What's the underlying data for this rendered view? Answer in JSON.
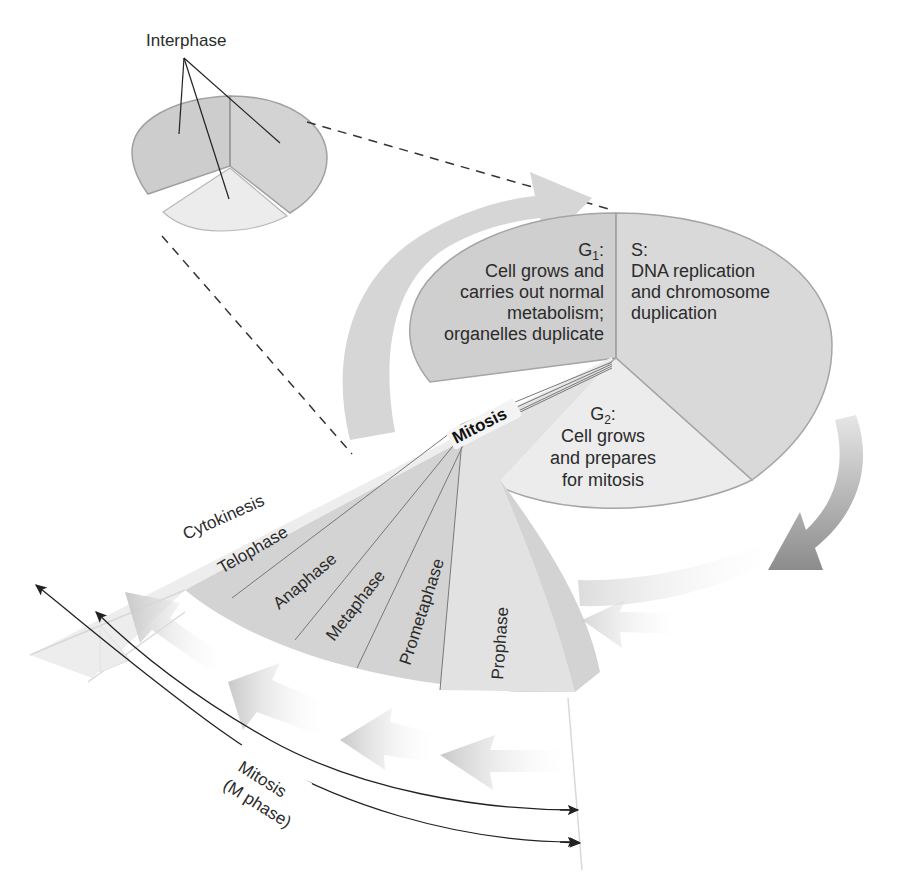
{
  "inset": {
    "label": "Interphase"
  },
  "interphase": {
    "g1": {
      "name": "G",
      "sub": "1",
      "colon": ":",
      "lines": [
        "Cell grows and",
        "carries out normal",
        "metabolism;",
        "organelles duplicate"
      ]
    },
    "s": {
      "name": "S:",
      "lines": [
        "DNA replication",
        "and chromosome",
        "duplication"
      ]
    },
    "g2": {
      "name": "G",
      "sub": "2",
      "colon": ":",
      "lines": [
        "Cell grows",
        "and prepares",
        "for mitosis"
      ]
    }
  },
  "mitosis": {
    "label": "Mitosis",
    "phases": [
      "Cytokinesis",
      "Telophase",
      "Anaphase",
      "Metaphase",
      "Prometaphase",
      "Prophase"
    ]
  },
  "bracket": {
    "line1": "Mitosis",
    "line2": "(M phase)"
  },
  "colors": {
    "g1_fill": "#cfcfcf",
    "s_fill": "#dadada",
    "g2_fill": "#ececec",
    "mitosis_fan": "#d4d4d4",
    "cytokinesis_band": "#ededed",
    "outline": "#9a9a9a",
    "arrow_light": "#d9d9d9",
    "arrow_dark": "#8a8a8a",
    "text": "#2b2b2b"
  }
}
